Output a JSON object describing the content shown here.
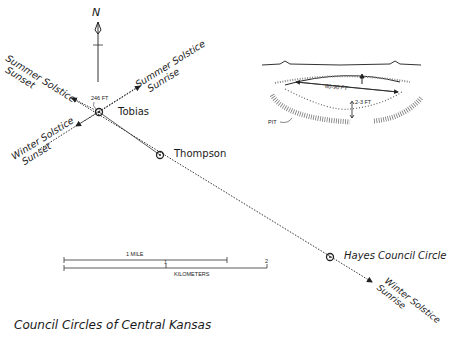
{
  "title": "Council Circles of Central Kansas",
  "compass": {
    "label": "N"
  },
  "sites": [
    {
      "name": "Tobias",
      "x": 99,
      "y": 112
    },
    {
      "name": "Thompson",
      "x": 160,
      "y": 155
    },
    {
      "name": "Hayes Council Circle",
      "x": 330,
      "y": 257
    }
  ],
  "distance_label": "246 FT",
  "directions": {
    "summer_sunset": [
      "Summer Solstice",
      "Sunset"
    ],
    "summer_sunrise": [
      "Summer Solstice",
      "Sunrise"
    ],
    "winter_sunset": [
      "Winter Solstice",
      "Sunset"
    ],
    "winter_sunrise": [
      "Winter Solstice",
      "Sunrise"
    ]
  },
  "inset": {
    "diameter_label": "60-90 FT",
    "depth_label": "2-3 FT",
    "pit_label": "PIT"
  },
  "scale_bar": {
    "mile_label": "1 MILE",
    "km_label": "KILOMETERS",
    "km_ticks": [
      "1",
      "2"
    ]
  }
}
